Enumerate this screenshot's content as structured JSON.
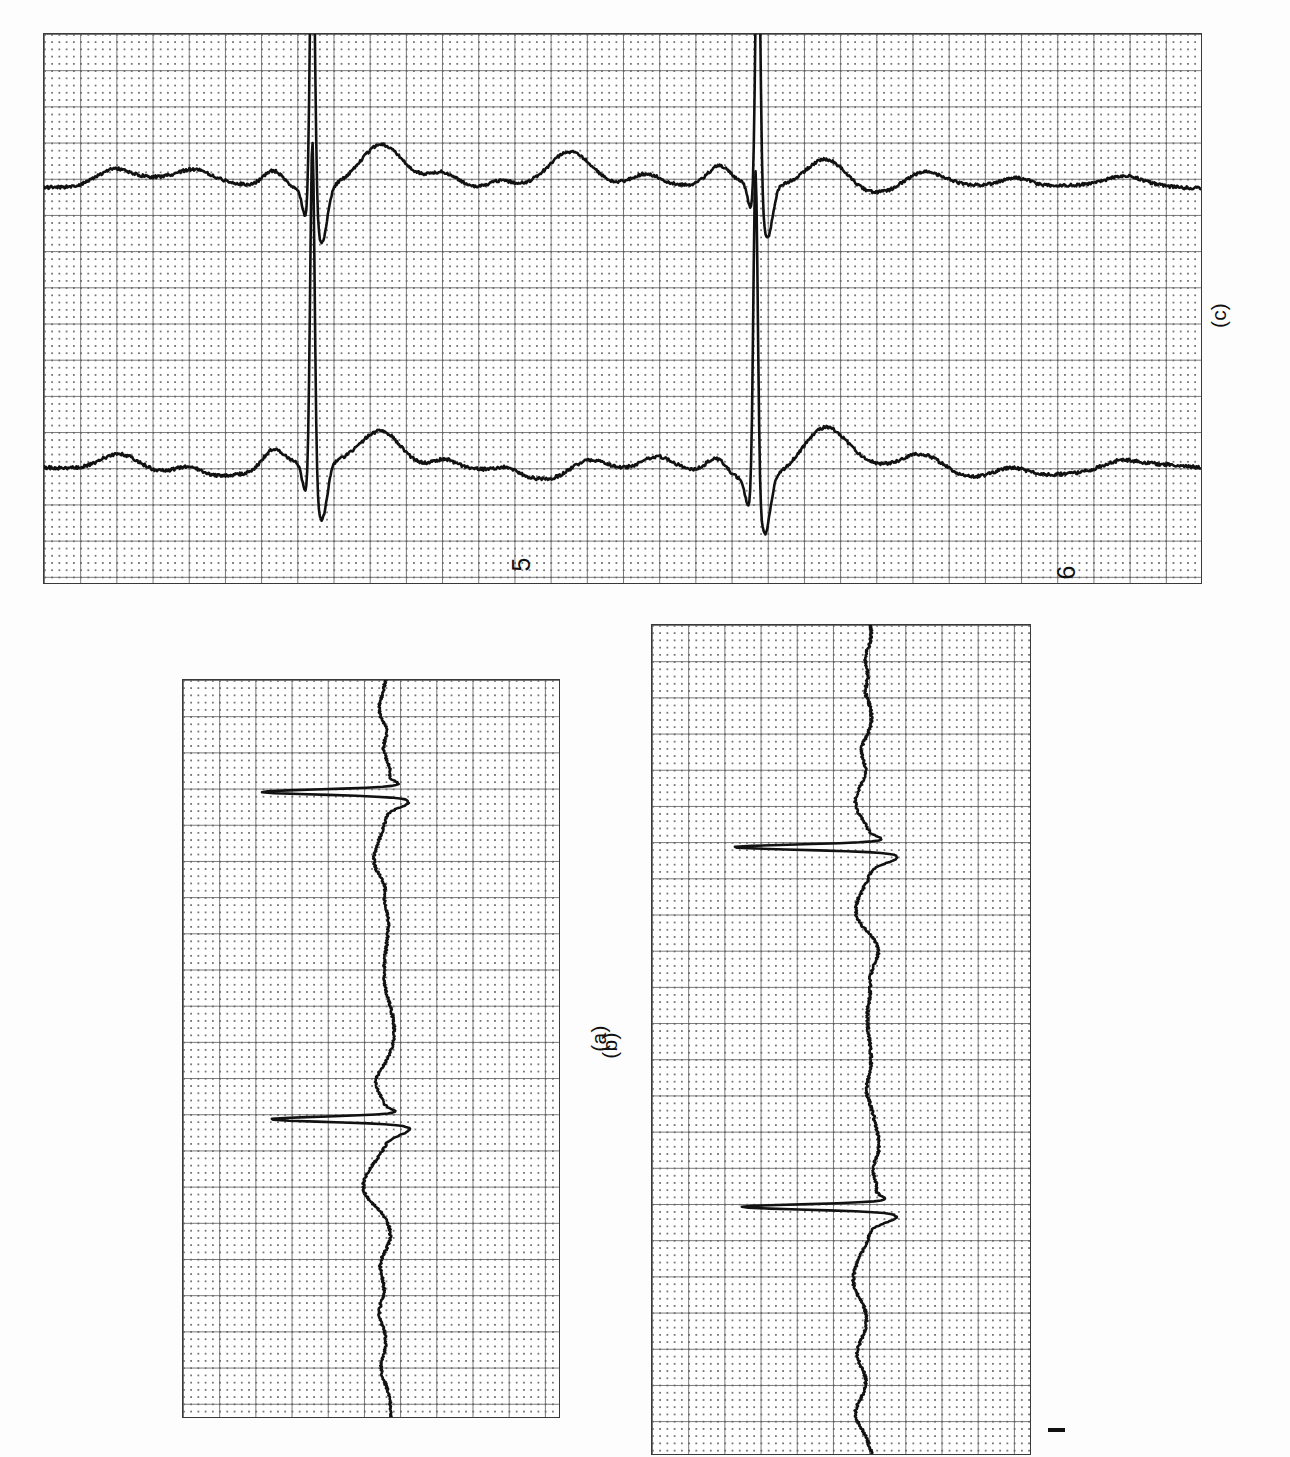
{
  "figure": {
    "kind": "ecg-rhythm-strips",
    "orientation": "rotated-90-ccw",
    "background_color": "#fdfdfd",
    "grid": {
      "major_square_px": 36.2,
      "minor_per_major": 5,
      "major_line_color": "#5f5f5f",
      "minor_dot_color": "#505050",
      "border_color": "#3a3a3a"
    },
    "trace_color": "#111111"
  },
  "panels": [
    {
      "id": "panel-a",
      "caption": "(a)",
      "caption_left": 585,
      "caption_top": 1028,
      "rect": {
        "left": 182,
        "top": 679,
        "width": 378,
        "height": 739
      },
      "strip_numbers": []
    },
    {
      "id": "panel-b",
      "caption": "(b)",
      "caption_left": 596,
      "caption_top": 1035,
      "rect": {
        "left": 651,
        "top": 624,
        "width": 380,
        "height": 831
      },
      "strip_numbers": [],
      "calibration_mark": {
        "left": 1048,
        "top": 1428,
        "width": 17,
        "height": 4
      }
    },
    {
      "id": "panel-c",
      "caption": "(c)",
      "caption_left": 1206,
      "caption_top": 305,
      "rect": {
        "left": 43,
        "top": 33,
        "width": 1159,
        "height": 551
      },
      "strip_numbers": [
        {
          "label": "5",
          "left": 515,
          "top": 552
        },
        {
          "label": "6",
          "left": 1060,
          "top": 560
        }
      ]
    }
  ],
  "chart_data": {
    "type": "line",
    "title": "",
    "xlabel": "",
    "ylabel": "",
    "panel_captions": [
      "(a)",
      "(b)",
      "(c)"
    ],
    "strip_labels_in_panel_c": [
      "5",
      "6"
    ],
    "series": [
      {
        "name": "(a)",
        "note": "single rhythm strip, two large QRS spikes",
        "qrs_positions_frac": [
          0.152,
          0.596
        ],
        "baseline_frac": 0.5
      },
      {
        "name": "(b)",
        "note": "single rhythm strip, two large QRS spikes, calibration mark at strip start",
        "qrs_positions_frac": [
          0.268,
          0.702
        ],
        "baseline_frac": 0.5
      },
      {
        "name": "(c) strip 5",
        "note": "upper strip in panel (c), two tall QRS spikes",
        "qrs_positions_frac": [
          0.232,
          0.615
        ],
        "baseline_frac": 0.5
      },
      {
        "name": "(c) strip 6",
        "note": "lower strip in panel (c), two tall QRS spikes",
        "qrs_positions_frac": [
          0.232,
          0.617
        ],
        "baseline_frac": 0.5
      }
    ],
    "grid_on": true,
    "legend_position": "none"
  }
}
